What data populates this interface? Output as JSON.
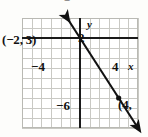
{
  "figure": {
    "title": "",
    "cropped_top_glyph": "=",
    "background": "#ffffff",
    "grid_color": "#c9c9c4",
    "axis_color": "#1a1a1a",
    "line_color": "#111111"
  },
  "axes": {
    "x_axis_label": "x",
    "y_axis_label": "y",
    "x_ticks_shown": [
      "−4",
      "4"
    ],
    "y_ticks_shown": [
      "2",
      "−6"
    ],
    "x_range": [
      -6,
      6
    ],
    "y_range": [
      -9,
      2
    ],
    "grid": true
  },
  "annotations": {
    "point_left_label": "(−2, 3)",
    "point_right_label": "(4,",
    "point_right_truncated": true
  },
  "chart_data": {
    "type": "line",
    "title": "",
    "xlabel": "x",
    "ylabel": "y",
    "xlim": [
      -6,
      6
    ],
    "ylim": [
      -9,
      2
    ],
    "grid": true,
    "legend": "none",
    "series": [
      {
        "name": "line through (−2, 3) and (4, −6)",
        "x": [
          -2,
          4
        ],
        "y": [
          3,
          -6
        ],
        "slope": -1.5,
        "intercept": 0,
        "arrows": "both",
        "markers": [
          {
            "x": -2,
            "y": 3,
            "label": "(−2, 3)",
            "drawn": false
          },
          {
            "x": 4,
            "y": -6,
            "label": "(4,",
            "drawn": true
          }
        ]
      }
    ],
    "xticks": [
      -4,
      4
    ],
    "xticklabels": [
      "−4",
      "4"
    ],
    "yticks": [
      2,
      -6
    ],
    "yticklabels": [
      "2",
      "−6"
    ]
  }
}
